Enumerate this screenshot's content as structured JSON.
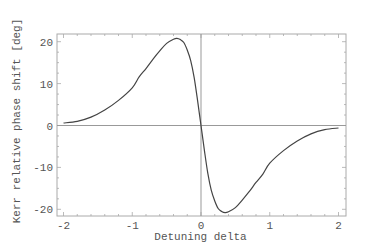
{
  "chart_data": {
    "type": "line",
    "title": "",
    "xlabel": "Detuning delta",
    "ylabel": "Kerr relative phase shift [deg]",
    "xlim": [
      -2,
      2
    ],
    "ylim": [
      -22,
      22
    ],
    "xticks": [
      -2,
      -1,
      0,
      1,
      2
    ],
    "yticks": [
      -20,
      -10,
      0,
      10,
      20
    ],
    "xtick_labels": [
      "-2",
      "-1",
      "0",
      "1",
      "2"
    ],
    "ytick_labels": [
      "-20",
      "-10",
      "0",
      "10",
      "20"
    ],
    "grid": false,
    "legend": null,
    "frame": true,
    "axes_through_origin": true,
    "series": [
      {
        "name": "Kerr relative phase shift",
        "color": "#444444",
        "x": [
          -2.0,
          -1.8,
          -1.6,
          -1.4,
          -1.2,
          -1.0,
          -0.9,
          -0.8,
          -0.7,
          -0.6,
          -0.5,
          -0.4,
          -0.35,
          -0.3,
          -0.25,
          -0.2,
          -0.15,
          -0.1,
          -0.05,
          0.0,
          0.05,
          0.1,
          0.15,
          0.2,
          0.25,
          0.3,
          0.35,
          0.4,
          0.5,
          0.6,
          0.7,
          0.8,
          0.9,
          1.0,
          1.2,
          1.4,
          1.6,
          1.8,
          2.0
        ],
        "y": [
          0.6,
          1.0,
          2.0,
          3.7,
          6.0,
          9.0,
          11.6,
          13.6,
          15.8,
          17.8,
          19.6,
          20.6,
          20.8,
          20.5,
          19.8,
          18.0,
          15.5,
          11.5,
          6.0,
          0.0,
          -6.0,
          -11.5,
          -15.5,
          -18.0,
          -19.8,
          -20.5,
          -20.8,
          -20.6,
          -19.6,
          -17.8,
          -15.8,
          -13.6,
          -11.6,
          -9.0,
          -6.0,
          -3.7,
          -2.0,
          -1.0,
          -0.6
        ]
      }
    ],
    "colors": {
      "curve": "#444444",
      "axes": "#999999",
      "frame": "#aaaaaa",
      "text": "#555555"
    }
  }
}
